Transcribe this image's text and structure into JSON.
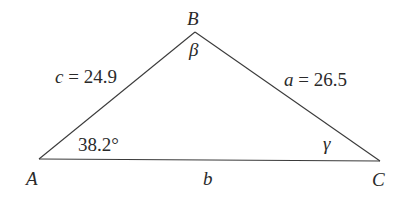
{
  "diagram": {
    "type": "triangle",
    "vertices": {
      "A": {
        "label": "A",
        "x": 39,
        "y": 159
      },
      "B": {
        "label": "B",
        "x": 195,
        "y": 32
      },
      "C": {
        "label": "C",
        "x": 380,
        "y": 161
      }
    },
    "sides": {
      "a": {
        "name": "a",
        "text": "a = 26.5",
        "value": 26.5,
        "between": [
          "B",
          "C"
        ]
      },
      "b": {
        "name": "b",
        "text": "b",
        "value": null,
        "between": [
          "A",
          "C"
        ]
      },
      "c": {
        "name": "c",
        "text": "c = 24.9",
        "value": 24.9,
        "between": [
          "A",
          "B"
        ]
      }
    },
    "angles": {
      "A": {
        "text": "38.2°",
        "value_deg": 38.2
      },
      "B": {
        "text": "β"
      },
      "C": {
        "text": "γ"
      }
    },
    "labels": {
      "vertex_A": "A",
      "vertex_B": "B",
      "vertex_C": "C",
      "side_b": "b",
      "side_c_var": "c",
      "side_c_val": " = 24.9",
      "side_a_var": "a",
      "side_a_val": " = 26.5",
      "angle_A": "38.2°",
      "angle_B": "β",
      "angle_C": "γ"
    },
    "colors": {
      "stroke": "#3a3a3a",
      "text": "#2a2a2a",
      "background": "#ffffff"
    }
  }
}
